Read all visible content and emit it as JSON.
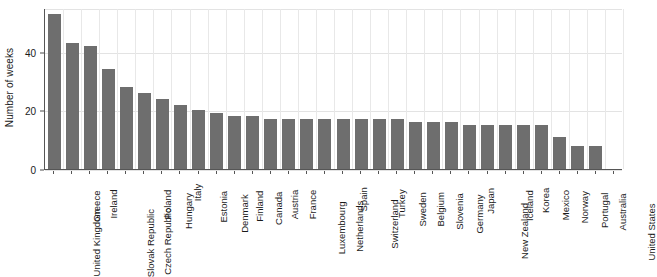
{
  "chart_data": {
    "type": "bar",
    "title": "",
    "xlabel": "",
    "ylabel": "Number of weeks",
    "ylim": [
      0,
      55
    ],
    "yticks": [
      0,
      20,
      40
    ],
    "ytick_labels": [
      "0",
      "20",
      "40"
    ],
    "grid": true,
    "legend": null,
    "bar_color": "#6e6e6e",
    "categories": [
      "United Kingdom",
      "Greece",
      "Ireland",
      "Slovak Republic",
      "Czech Republic",
      "Poland",
      "Hungary",
      "Italy",
      "Estonia",
      "Denmark",
      "Finland",
      "Canada",
      "Austria",
      "France",
      "Luxembourg",
      "Netherlands",
      "Spain",
      "Switzerland",
      "Turkey",
      "Sweden",
      "Belgium",
      "Slovenia",
      "Germany",
      "Japan",
      "New Zealand",
      "Iceland",
      "Korea",
      "Mexico",
      "Norway",
      "Portugal",
      "Australia",
      "United States"
    ],
    "values": [
      53,
      43,
      42,
      34,
      28,
      26,
      24,
      22,
      20,
      19,
      18,
      18,
      17,
      17,
      17,
      17,
      17,
      17,
      17,
      17,
      16,
      16,
      16,
      15,
      15,
      15,
      15,
      15,
      11,
      8,
      8,
      0
    ]
  },
  "axes": {
    "y_title": "Number of weeks"
  }
}
